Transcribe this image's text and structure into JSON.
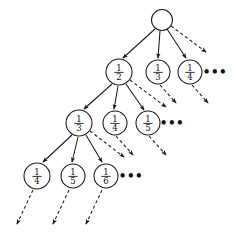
{
  "figure": {
    "name": "infinite-tree-of-unit-fractions",
    "canvas": {
      "width": 235,
      "height": 238,
      "background": "#ffffff"
    },
    "stroke_color": "#1a1a1a",
    "text_color": "#111111",
    "ellipsis_label": "•••"
  },
  "nodes": [
    {
      "id": "root",
      "label": "",
      "numerator": "",
      "denominator": "",
      "cx": 162,
      "cy": 20,
      "r": 10.5,
      "level": 0
    },
    {
      "id": "l1n1",
      "label": "1/2",
      "numerator": "1",
      "denominator": "2",
      "cx": 119,
      "cy": 72,
      "r": 13.0,
      "level": 1
    },
    {
      "id": "l1n2",
      "label": "1/3",
      "numerator": "1",
      "denominator": "3",
      "cx": 158,
      "cy": 72,
      "r": 12.0,
      "level": 1
    },
    {
      "id": "l1n3",
      "label": "1/4",
      "numerator": "1",
      "denominator": "4",
      "cx": 190,
      "cy": 72,
      "r": 12.0,
      "level": 1
    },
    {
      "id": "l2n1",
      "label": "1/3",
      "numerator": "1",
      "denominator": "3",
      "cx": 79,
      "cy": 123,
      "r": 13.0,
      "level": 2
    },
    {
      "id": "l2n2",
      "label": "1/4",
      "numerator": "1",
      "denominator": "4",
      "cx": 115,
      "cy": 123,
      "r": 12.0,
      "level": 2
    },
    {
      "id": "l2n3",
      "label": "1/5",
      "numerator": "1",
      "denominator": "5",
      "cx": 148,
      "cy": 123,
      "r": 12.0,
      "level": 2
    },
    {
      "id": "l3n1",
      "label": "1/4",
      "numerator": "1",
      "denominator": "4",
      "cx": 37,
      "cy": 176,
      "r": 13.0,
      "level": 3
    },
    {
      "id": "l3n2",
      "label": "1/5",
      "numerator": "1",
      "denominator": "5",
      "cx": 73,
      "cy": 176,
      "r": 12.0,
      "level": 3
    },
    {
      "id": "l3n3",
      "label": "1/6",
      "numerator": "1",
      "denominator": "6",
      "cx": 106,
      "cy": 176,
      "r": 12.0,
      "level": 3
    }
  ],
  "ellipses": [
    {
      "id": "ell-level1",
      "text": "•••",
      "x": 215,
      "y": 76
    },
    {
      "id": "ell-level2",
      "text": "•••",
      "x": 172,
      "y": 127
    },
    {
      "id": "ell-level3",
      "text": "•••",
      "x": 131,
      "y": 180
    }
  ],
  "edges_solid": [
    {
      "id": "root-to-half",
      "x1": 155,
      "y1": 29,
      "x2": 123,
      "y2": 58
    },
    {
      "id": "root-to-third",
      "x1": 160,
      "y1": 31,
      "x2": 158,
      "y2": 58
    },
    {
      "id": "root-to-quarter",
      "x1": 167,
      "y1": 29,
      "x2": 186,
      "y2": 58
    },
    {
      "id": "half-to-third",
      "x1": 112,
      "y1": 84,
      "x2": 84,
      "y2": 109
    },
    {
      "id": "half-to-quarter",
      "x1": 118,
      "y1": 86,
      "x2": 114,
      "y2": 109
    },
    {
      "id": "half-to-fifth",
      "x1": 126,
      "y1": 84,
      "x2": 144,
      "y2": 110
    },
    {
      "id": "third-to-quarter",
      "x1": 72,
      "y1": 135,
      "x2": 43,
      "y2": 162
    },
    {
      "id": "third-to-fifth",
      "x1": 78,
      "y1": 137,
      "x2": 72,
      "y2": 162
    },
    {
      "id": "third-to-sixth",
      "x1": 86,
      "y1": 135,
      "x2": 102,
      "y2": 162
    }
  ],
  "edges_dashed": [
    {
      "id": "root-dashed-tail",
      "x1": 171,
      "y1": 26,
      "x2": 206,
      "y2": 52
    },
    {
      "id": "l1n2-dashed-tail",
      "x1": 160,
      "y1": 85,
      "x2": 176,
      "y2": 103
    },
    {
      "id": "l1n3-dashed-tail",
      "x1": 192,
      "y1": 85,
      "x2": 208,
      "y2": 103
    },
    {
      "id": "half-dashed-tail",
      "x1": 130,
      "y1": 80,
      "x2": 166,
      "y2": 107
    },
    {
      "id": "l2n2-dashed-tail",
      "x1": 116,
      "y1": 136,
      "x2": 133,
      "y2": 155
    },
    {
      "id": "l2n3-dashed-tail",
      "x1": 149,
      "y1": 136,
      "x2": 166,
      "y2": 155
    },
    {
      "id": "third-dashed-tail",
      "x1": 90,
      "y1": 131,
      "x2": 124,
      "y2": 157
    },
    {
      "id": "l3n1-dashed-tail",
      "x1": 33,
      "y1": 190,
      "x2": 17,
      "y2": 224
    },
    {
      "id": "l3n2-dashed-tail",
      "x1": 69,
      "y1": 190,
      "x2": 53,
      "y2": 224
    },
    {
      "id": "l3n3-dashed-tail",
      "x1": 102,
      "y1": 190,
      "x2": 86,
      "y2": 224
    }
  ]
}
